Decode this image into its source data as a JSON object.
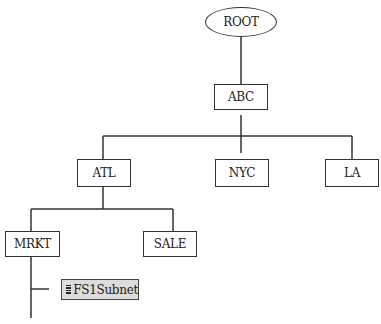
{
  "tree": {
    "root": {
      "label": "ROOT"
    },
    "abc": {
      "label": "ABC"
    },
    "level2": [
      {
        "label": "ATL"
      },
      {
        "label": "NYC"
      },
      {
        "label": "LA"
      }
    ],
    "level3": [
      {
        "label": "MRKT"
      },
      {
        "label": "SALE"
      }
    ],
    "subnet": {
      "label": "FS1Subnet",
      "icon": "list-icon"
    }
  },
  "colors": {
    "line": "#333333",
    "selected_bg": "#dcdcdc"
  }
}
